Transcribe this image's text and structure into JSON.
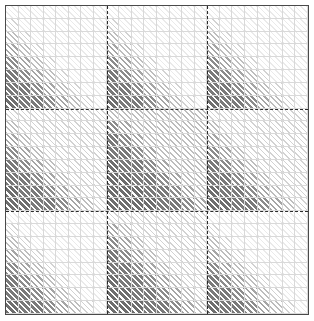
{
  "figure": {
    "title": "",
    "width": 314,
    "height": 321,
    "background": "#ffffff",
    "frame_color": "#4a4a4a",
    "gridline_color": "#d9d9d9",
    "partition_line_color": "#2b2b2b",
    "partition_line_style": "dashed"
  },
  "chart_data": {
    "type": "heatmap",
    "title": "",
    "subtitle": "",
    "xlabel": "",
    "ylabel": "",
    "legend": [],
    "annotations": [],
    "grid": true,
    "legend_position": "none",
    "rows": 24,
    "cols": 24,
    "xlim": [
      0,
      24
    ],
    "ylim": [
      0,
      24
    ],
    "xticklabels": [],
    "yticklabels": [],
    "block_rows": 3,
    "block_cols": 3,
    "block_size": 8,
    "partition_x": [
      8,
      16
    ],
    "partition_y": [
      8,
      16
    ],
    "value_scale": {
      "min": 0,
      "max": 6,
      "levels": 7,
      "level_colors": [
        "#eaeaea",
        "#d2d2d2",
        "#bdbdbd",
        "#a5a5a5",
        "#8c8c8c",
        "#7a7a7a",
        "#6e6e6e"
      ],
      "fill_style": "45deg-diagonal-hatch"
    },
    "values": [
      [
        0,
        0,
        0,
        0,
        0,
        0,
        0,
        0,
        0,
        0,
        0,
        0,
        0,
        0,
        0,
        0,
        0,
        0,
        0,
        0,
        0,
        0,
        0,
        0
      ],
      [
        1,
        0,
        0,
        0,
        0,
        0,
        0,
        0,
        1,
        0,
        0,
        0,
        0,
        0,
        0,
        0,
        1,
        0,
        0,
        0,
        0,
        0,
        0,
        0
      ],
      [
        2,
        1,
        0,
        0,
        0,
        0,
        0,
        0,
        2,
        1,
        0,
        0,
        0,
        0,
        0,
        0,
        2,
        1,
        0,
        0,
        0,
        0,
        0,
        0
      ],
      [
        3,
        2,
        1,
        0,
        0,
        0,
        0,
        0,
        3,
        2,
        1,
        0,
        0,
        0,
        0,
        0,
        3,
        2,
        1,
        0,
        0,
        0,
        0,
        0
      ],
      [
        4,
        3,
        2,
        1,
        0,
        0,
        0,
        0,
        4,
        3,
        2,
        1,
        0,
        0,
        0,
        0,
        4,
        3,
        2,
        1,
        0,
        0,
        0,
        0
      ],
      [
        5,
        4,
        3,
        2,
        1,
        0,
        0,
        0,
        5,
        4,
        3,
        2,
        1,
        0,
        0,
        0,
        5,
        4,
        3,
        2,
        1,
        0,
        0,
        0
      ],
      [
        5,
        5,
        4,
        3,
        2,
        1,
        0,
        0,
        5,
        5,
        4,
        3,
        2,
        1,
        0,
        0,
        5,
        5,
        4,
        3,
        2,
        1,
        0,
        0
      ],
      [
        6,
        5,
        5,
        4,
        3,
        2,
        1,
        0,
        6,
        5,
        5,
        4,
        3,
        2,
        1,
        0,
        6,
        5,
        5,
        4,
        3,
        2,
        1,
        0
      ],
      [
        1,
        1,
        1,
        1,
        1,
        1,
        1,
        1,
        2,
        2,
        2,
        2,
        2,
        2,
        2,
        2,
        1,
        1,
        1,
        1,
        1,
        1,
        1,
        1
      ],
      [
        2,
        1,
        1,
        1,
        1,
        1,
        1,
        1,
        4,
        3,
        2,
        2,
        2,
        2,
        2,
        2,
        2,
        1,
        1,
        1,
        1,
        1,
        1,
        1
      ],
      [
        3,
        2,
        1,
        1,
        1,
        1,
        1,
        1,
        5,
        4,
        3,
        2,
        2,
        2,
        2,
        2,
        3,
        2,
        1,
        1,
        1,
        1,
        1,
        1
      ],
      [
        4,
        3,
        2,
        1,
        1,
        1,
        1,
        1,
        5,
        5,
        4,
        3,
        2,
        2,
        2,
        2,
        4,
        3,
        2,
        1,
        1,
        1,
        1,
        1
      ],
      [
        5,
        4,
        3,
        2,
        1,
        1,
        1,
        1,
        6,
        5,
        5,
        4,
        3,
        2,
        2,
        2,
        5,
        4,
        3,
        2,
        1,
        1,
        1,
        1
      ],
      [
        5,
        5,
        4,
        3,
        2,
        1,
        1,
        1,
        6,
        6,
        5,
        5,
        4,
        3,
        2,
        2,
        5,
        5,
        4,
        3,
        2,
        1,
        1,
        1
      ],
      [
        6,
        5,
        5,
        4,
        3,
        2,
        1,
        1,
        6,
        6,
        6,
        5,
        5,
        4,
        3,
        2,
        6,
        5,
        5,
        4,
        3,
        2,
        1,
        1
      ],
      [
        6,
        6,
        5,
        5,
        4,
        3,
        2,
        1,
        6,
        6,
        6,
        6,
        5,
        5,
        4,
        3,
        6,
        6,
        5,
        5,
        4,
        3,
        2,
        1
      ],
      [
        0,
        0,
        0,
        0,
        0,
        0,
        0,
        0,
        1,
        1,
        1,
        1,
        1,
        1,
        1,
        1,
        0,
        0,
        0,
        0,
        0,
        0,
        0,
        0
      ],
      [
        1,
        0,
        0,
        0,
        0,
        0,
        0,
        0,
        3,
        2,
        1,
        1,
        1,
        1,
        1,
        1,
        1,
        0,
        0,
        0,
        0,
        0,
        0,
        0
      ],
      [
        2,
        1,
        0,
        0,
        0,
        0,
        0,
        0,
        4,
        3,
        2,
        1,
        1,
        1,
        1,
        1,
        2,
        1,
        0,
        0,
        0,
        0,
        0,
        0
      ],
      [
        3,
        2,
        1,
        0,
        0,
        0,
        0,
        0,
        5,
        4,
        3,
        2,
        1,
        1,
        1,
        1,
        3,
        2,
        1,
        0,
        0,
        0,
        0,
        0
      ],
      [
        4,
        3,
        2,
        1,
        0,
        0,
        0,
        0,
        5,
        5,
        4,
        3,
        2,
        1,
        1,
        1,
        4,
        3,
        2,
        1,
        0,
        0,
        0,
        0
      ],
      [
        5,
        4,
        3,
        2,
        1,
        0,
        0,
        0,
        6,
        5,
        5,
        4,
        3,
        2,
        1,
        1,
        5,
        4,
        3,
        2,
        1,
        0,
        0,
        0
      ],
      [
        5,
        5,
        4,
        3,
        2,
        1,
        0,
        0,
        6,
        6,
        5,
        5,
        4,
        3,
        2,
        1,
        5,
        5,
        4,
        3,
        2,
        1,
        0,
        0
      ],
      [
        6,
        5,
        5,
        4,
        3,
        2,
        1,
        0,
        6,
        6,
        6,
        5,
        5,
        4,
        3,
        2,
        6,
        5,
        5,
        4,
        3,
        2,
        1,
        0
      ]
    ]
  }
}
